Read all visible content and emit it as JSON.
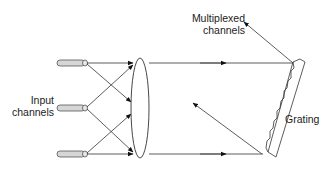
{
  "diagram": {
    "labels": {
      "multiplexed": [
        "Multiplexed",
        "channels"
      ],
      "input": [
        "Input",
        "channels"
      ],
      "grating": "Grating"
    },
    "components": {
      "fibers": [
        {
          "id": "fiber-1",
          "y": 63
        },
        {
          "id": "fiber-2",
          "y": 108
        },
        {
          "id": "fiber-3",
          "y": 154
        }
      ],
      "lens": {
        "cx": 140,
        "cy": 108,
        "rx": 9,
        "ry": 50
      },
      "grating": {
        "top": [
          300,
          62
        ],
        "bottom": [
          268,
          155
        ]
      }
    },
    "colors": {
      "line": "#333333",
      "fiber_fill": "#d6d6d6",
      "fiber_stroke": "#555555"
    }
  }
}
